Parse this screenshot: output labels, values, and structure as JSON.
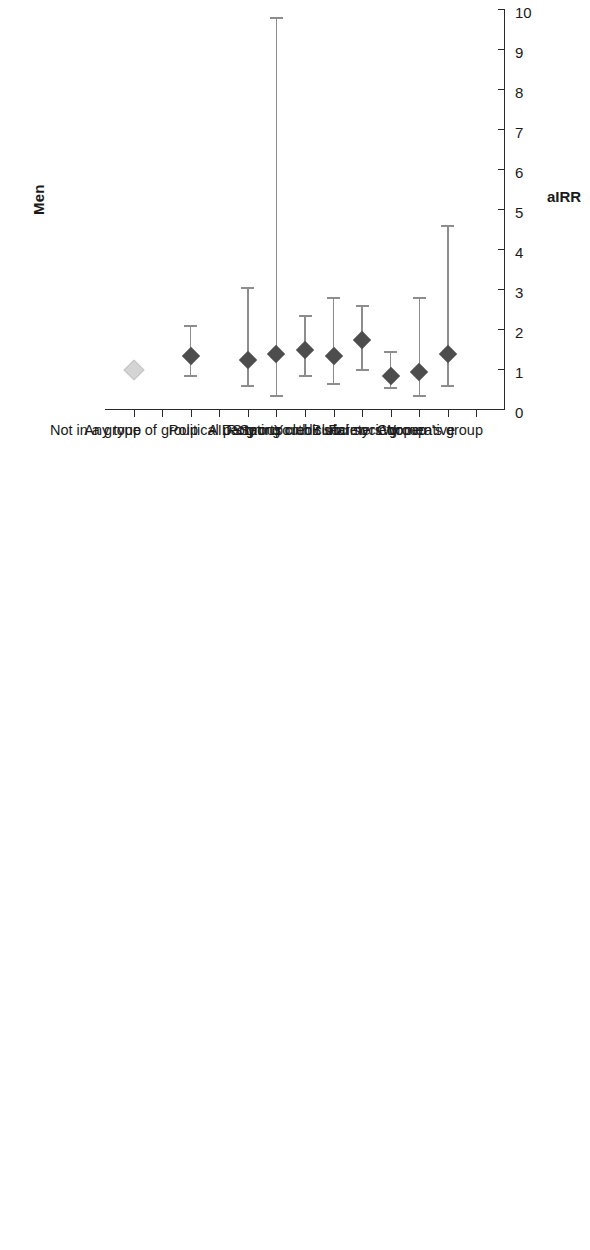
{
  "figure": {
    "panels": [
      {
        "id": "men",
        "title": "Men",
        "axis_title": "aIRR",
        "xlim": [
          0,
          10
        ],
        "ticks": [
          "0",
          "1",
          "2",
          "3",
          "4",
          "5",
          "6",
          "7",
          "8",
          "9",
          "10"
        ]
      },
      {
        "id": "women",
        "title": "Women",
        "axis_title": "aIRR",
        "xlim": [
          0,
          3
        ],
        "ticks": [
          "0",
          "1",
          "2",
          "3"
        ]
      }
    ]
  },
  "categories": [
    "Women's group",
    "Cooperative",
    "Farmers' group",
    "Burial society",
    "Rotating credit society",
    "Youth club",
    "Sports club",
    "AIDS group",
    "Political party",
    "",
    "Any type of group",
    "",
    "Not in a group"
  ],
  "colors": {
    "marker": "#4d4d4d",
    "reference_marker": "#d4d4d4",
    "error_bar": "#8d8d8d",
    "axis": "#2a2a2a",
    "text": "#1a1a1a"
  },
  "chart_data": [
    {
      "type": "scatter",
      "title": "Men",
      "xlabel": "aIRR",
      "ylabel": "",
      "xlim": [
        0,
        10
      ],
      "grid": false,
      "legend": "none",
      "orientation": "horizontal-forest",
      "reference_line": 1,
      "categories": [
        "Women's group",
        "Cooperative",
        "Farmers' group",
        "Burial society",
        "Rotating credit society",
        "Youth club",
        "Sports club",
        "AIDS group",
        "Political party",
        "",
        "Any type of group",
        "",
        "Not in a group"
      ],
      "points": [
        {
          "category": "Women's group",
          "estimate": null,
          "ci_low": null,
          "ci_high": null,
          "reference": false
        },
        {
          "category": "Cooperative",
          "estimate": 1.4,
          "ci_low": 0.6,
          "ci_high": 4.6,
          "reference": false
        },
        {
          "category": "Farmers' group",
          "estimate": 0.95,
          "ci_low": 0.35,
          "ci_high": 2.8,
          "reference": false
        },
        {
          "category": "Burial society",
          "estimate": 0.85,
          "ci_low": 0.55,
          "ci_high": 1.45,
          "reference": false
        },
        {
          "category": "Rotating credit society",
          "estimate": 1.75,
          "ci_low": 1.0,
          "ci_high": 2.6,
          "reference": false
        },
        {
          "category": "Youth club",
          "estimate": 1.35,
          "ci_low": 0.65,
          "ci_high": 2.8,
          "reference": false
        },
        {
          "category": "Sports club",
          "estimate": 1.5,
          "ci_low": 0.85,
          "ci_high": 2.35,
          "reference": false
        },
        {
          "category": "AIDS group",
          "estimate": 1.4,
          "ci_low": 0.35,
          "ci_high": 9.8,
          "reference": false
        },
        {
          "category": "Political party",
          "estimate": 1.25,
          "ci_low": 0.6,
          "ci_high": 3.05,
          "reference": false
        },
        {
          "category": "",
          "estimate": null,
          "ci_low": null,
          "ci_high": null,
          "reference": false
        },
        {
          "category": "Any type of group",
          "estimate": 1.35,
          "ci_low": 0.85,
          "ci_high": 2.1,
          "reference": false
        },
        {
          "category": "",
          "estimate": null,
          "ci_low": null,
          "ci_high": null,
          "reference": false
        },
        {
          "category": "Not in a group",
          "estimate": 1.0,
          "ci_low": null,
          "ci_high": null,
          "reference": true
        }
      ]
    },
    {
      "type": "scatter",
      "title": "Women",
      "xlabel": "aIRR",
      "ylabel": "",
      "xlim": [
        0,
        3
      ],
      "grid": false,
      "legend": "none",
      "orientation": "horizontal-forest",
      "reference_line": 1,
      "categories": [
        "Women's group",
        "Cooperative",
        "Farmers' group",
        "Burial society",
        "Rotating credit society",
        "Youth club",
        "Sports club",
        "AIDS group",
        "Political party",
        "",
        "Any type of group",
        "",
        "Not in a group"
      ],
      "points": [
        {
          "category": "Women's group",
          "estimate": 0.62,
          "ci_low": 0.3,
          "ci_high": 1.35,
          "reference": false
        },
        {
          "category": "Cooperative",
          "estimate": 0.68,
          "ci_low": 0.22,
          "ci_high": 1.75,
          "reference": false
        },
        {
          "category": "Farmers' group",
          "estimate": 0.62,
          "ci_low": 0.3,
          "ci_high": 1.25,
          "reference": false
        },
        {
          "category": "Burial society",
          "estimate": 0.52,
          "ci_low": 0.28,
          "ci_high": 1.0,
          "reference": false
        },
        {
          "category": "Rotating credit society",
          "estimate": 0.55,
          "ci_low": 0.27,
          "ci_high": 1.08,
          "reference": false
        },
        {
          "category": "Youth club",
          "estimate": 0.63,
          "ci_low": 0.35,
          "ci_high": 1.65,
          "reference": false
        },
        {
          "category": "Sports club",
          "estimate": 0.3,
          "ci_low": 0.12,
          "ci_high": 1.42,
          "reference": false
        },
        {
          "category": "AIDS group",
          "estimate": 0.78,
          "ci_low": 0.27,
          "ci_high": 2.2,
          "reference": false
        },
        {
          "category": "Political party",
          "estimate": 0.22,
          "ci_low": 0.02,
          "ci_high": 1.8,
          "reference": false
        },
        {
          "category": "",
          "estimate": null,
          "ci_low": null,
          "ci_high": null,
          "reference": false
        },
        {
          "category": "Any type of group",
          "estimate": 0.55,
          "ci_low": 0.35,
          "ci_high": 0.85,
          "reference": false
        },
        {
          "category": "",
          "estimate": null,
          "ci_low": null,
          "ci_high": null,
          "reference": false
        },
        {
          "category": "Not in a group",
          "estimate": 1.0,
          "ci_low": null,
          "ci_high": null,
          "reference": true
        }
      ]
    }
  ]
}
